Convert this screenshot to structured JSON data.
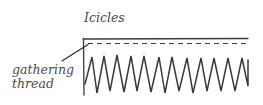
{
  "diagram": {
    "title": "Icicles",
    "callout": {
      "line1": "gathering",
      "line2": "thread"
    },
    "colors": {
      "ink": "#3a3a3a",
      "text": "#4a4a4a",
      "background": "#ffffff"
    }
  }
}
